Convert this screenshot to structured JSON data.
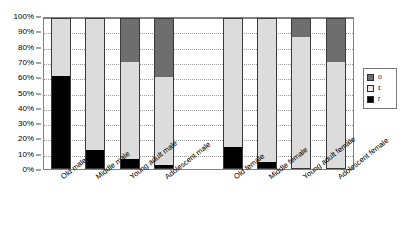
{
  "chart_data": {
    "type": "bar",
    "subtype": "100% stacked column",
    "title": "",
    "xlabel": "",
    "ylabel": "",
    "ylim": [
      0,
      100
    ],
    "yticks": [
      "0%",
      "10%",
      "20%",
      "30%",
      "40%",
      "50%",
      "60%",
      "70%",
      "80%",
      "90%",
      "100%"
    ],
    "grid": "horizontal dotted gridlines",
    "legend_position": "right",
    "categories": [
      "Old male",
      "Middle male",
      "Young adult male",
      "Adolescent male",
      "Old female",
      "Middle female",
      "Young adult female",
      "Adolescent female"
    ],
    "series": [
      {
        "name": "r",
        "legend_label": "r",
        "color": "#000000",
        "values": [
          62,
          12,
          6,
          2,
          14,
          4,
          0,
          0
        ]
      },
      {
        "name": "ɪ",
        "legend_label": "ɪ",
        "color": "#dcdcdc",
        "values": [
          38,
          88,
          65,
          59,
          86,
          96,
          88,
          71
        ]
      },
      {
        "name": "ʊ",
        "legend_label": "ʊ",
        "color": "#6e6e6e",
        "values": [
          0,
          0,
          29,
          39,
          0,
          0,
          12,
          29
        ]
      }
    ]
  },
  "legend": {
    "items": [
      {
        "label": "ʊ",
        "swatch": "dark-gray-swatch"
      },
      {
        "label": "ɪ",
        "swatch": "light-gray-swatch"
      },
      {
        "label": "r",
        "swatch": "black-swatch"
      }
    ]
  },
  "colors": {
    "series_top": "#6e6e6e",
    "series_mid": "#dcdcdc",
    "series_bottom": "#000000",
    "frame": "#808080",
    "gridline": "#9a9a9a",
    "text": "#000000",
    "background": "#ffffff"
  }
}
